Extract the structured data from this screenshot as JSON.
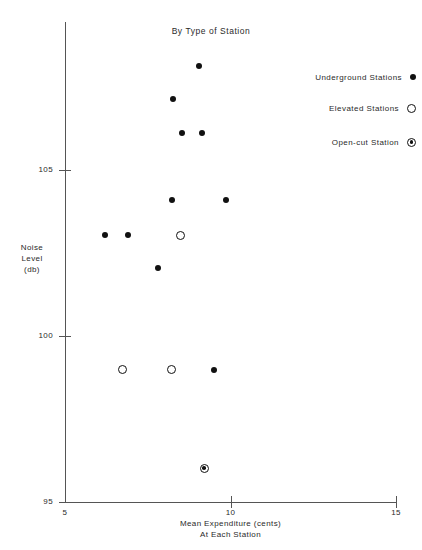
{
  "chart_data": {
    "type": "scatter",
    "title": "By Type of Station",
    "xlabel_line1": "Mean Expenditure (cents)",
    "xlabel_line2": "At Each Station",
    "ylabel_line1": "Noise",
    "ylabel_line2": "Level",
    "ylabel_line3": "(db)",
    "xlim": [
      5,
      15
    ],
    "ylim": [
      95,
      105.9
    ],
    "xticks": [
      5,
      10,
      15
    ],
    "xtick_labels": [
      "5",
      "10",
      "15"
    ],
    "yticks": [
      95,
      100,
      105
    ],
    "ytick_labels": [
      "95",
      "100",
      "105"
    ],
    "grid": false,
    "legend_position": "top-right",
    "marker_color": "#111111",
    "axis_color": "#555555",
    "series": [
      {
        "name": "Underground Stations",
        "marker": "filled-circle",
        "points": [
          {
            "x": 9.05,
            "y": 108.14
          },
          {
            "x": 8.26,
            "y": 107.14
          },
          {
            "x": 8.53,
            "y": 106.12
          },
          {
            "x": 9.14,
            "y": 106.12
          },
          {
            "x": 8.23,
            "y": 104.11
          },
          {
            "x": 9.86,
            "y": 104.11
          },
          {
            "x": 6.21,
            "y": 103.03
          },
          {
            "x": 6.9,
            "y": 103.03
          },
          {
            "x": 7.81,
            "y": 102.06
          },
          {
            "x": 9.5,
            "y": 98.99
          }
        ]
      },
      {
        "name": "Elevated Stations",
        "marker": "open-circle",
        "points": [
          {
            "x": 8.48,
            "y": 103.03
          },
          {
            "x": 6.75,
            "y": 98.99
          },
          {
            "x": 8.23,
            "y": 98.99
          }
        ]
      },
      {
        "name": "Open-cut Station",
        "marker": "bullseye",
        "points": [
          {
            "x": 9.2,
            "y": 96.02
          }
        ]
      }
    ]
  },
  "legend": {
    "items": [
      {
        "label": "Underground Stations",
        "marker": "filled-circle"
      },
      {
        "label": "Elevated Stations",
        "marker": "open-circle"
      },
      {
        "label": "Open-cut Station",
        "marker": "bullseye"
      }
    ]
  }
}
